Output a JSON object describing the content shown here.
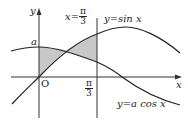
{
  "diagram": {
    "type": "function-graph",
    "colors": {
      "curve": "#222222",
      "axis": "#333333",
      "shade": "#c8c8c8"
    },
    "axes": {
      "x_label": "x",
      "y_label": "y",
      "origin_label": "O"
    },
    "labels": {
      "a": "a",
      "vline_lhs": "x=",
      "pi": "π",
      "three": "3",
      "tick_pi": "π",
      "tick_three": "3",
      "sin_curve": "y=sin x",
      "cos_curve": "y=a cos x"
    },
    "curves": [
      {
        "name": "sin",
        "expr": "y = sin x"
      },
      {
        "name": "cos",
        "expr": "y = a cos x"
      }
    ],
    "vertical_line": "x = π/3",
    "shaded_region": "between y=sin x and y=a cos x for 0 ≤ x ≤ π/3"
  }
}
